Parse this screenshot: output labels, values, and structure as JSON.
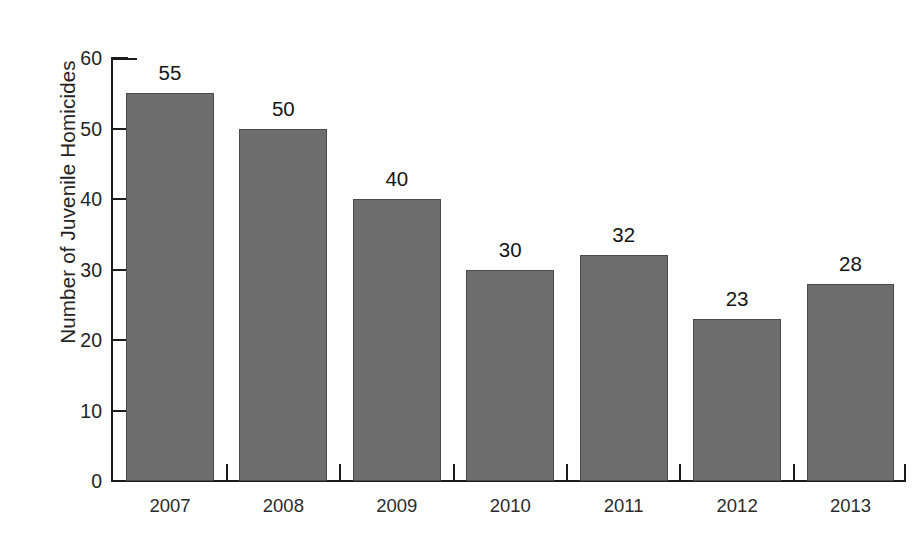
{
  "chart_data": {
    "type": "bar",
    "title": "",
    "xlabel": "",
    "ylabel": "Number of Juvenile Homicides",
    "categories": [
      "2007",
      "2008",
      "2009",
      "2010",
      "2011",
      "2012",
      "2013"
    ],
    "values": [
      55,
      50,
      40,
      30,
      32,
      23,
      28
    ],
    "value_labels": [
      "55",
      "50",
      "40",
      "30",
      "32",
      "23",
      "28"
    ],
    "ylim": [
      0,
      60
    ],
    "ytick_values": [
      0,
      10,
      20,
      30,
      40,
      50,
      60
    ],
    "ytick_labels": [
      "0",
      "10",
      "20",
      "30",
      "40",
      "50",
      "60"
    ],
    "grid": false,
    "legend": false,
    "bar_color": "#6e6e6e",
    "bar_edge_color": "#4a4a4a",
    "axis_color": "#1c1c1c",
    "background_color": "#ffffff",
    "text_color": "#242424"
  }
}
